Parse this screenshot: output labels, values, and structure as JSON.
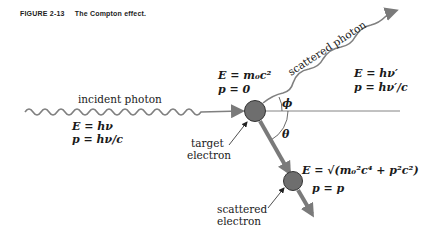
{
  "caption": {
    "figure_number": "FIGURE 2-13",
    "title": "The Compton effect."
  },
  "labels": {
    "incident_photon": "incident photon",
    "scattered_photon": "scattered photon",
    "target_electron_line1": "target",
    "target_electron_line2": "electron",
    "scattered_electron_line1": "scattered",
    "scattered_electron_line2": "electron",
    "phi": "ϕ",
    "theta": "θ"
  },
  "equations": {
    "incident_E": "E = hν",
    "incident_p": "p = hν/c",
    "target_E": "E = m₀c²",
    "target_p": "p = 0",
    "scattered_photon_E": "E = hν′",
    "scattered_photon_p": "p = hν′/c",
    "scattered_electron_E": "E = √(m₀²c⁴ + p²c²)",
    "scattered_electron_p": "p = p"
  },
  "colors": {
    "wave": "#808080",
    "electron_fill": "#6e6e6e",
    "arrow": "#7a7a7a",
    "text": "#1a1a1a"
  }
}
